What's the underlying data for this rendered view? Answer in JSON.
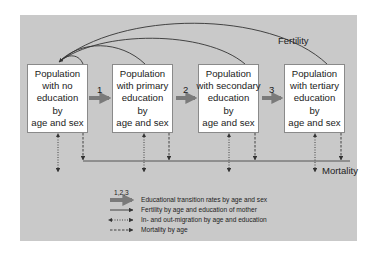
{
  "diagram": {
    "type": "flow",
    "boxes": [
      {
        "lines": [
          "Population",
          "with no",
          "education",
          "by",
          "age and sex"
        ]
      },
      {
        "lines": [
          "Population",
          "with primary",
          "education",
          "by",
          "age and sex"
        ]
      },
      {
        "lines": [
          "Population",
          "with secondary",
          "education",
          "by",
          "age and sex"
        ]
      },
      {
        "lines": [
          "Population",
          "with tertiary",
          "education",
          "by",
          "age and sex"
        ]
      }
    ],
    "transitions": [
      "1",
      "2",
      "3"
    ],
    "fertility_label": "Fertility",
    "mortality_label": "Mortality",
    "legend": {
      "transition_numbers": "1,2,3",
      "items": [
        {
          "style": "thick-grey-arrow",
          "label": "Educational transition rates by age and sex"
        },
        {
          "style": "solid-arrow",
          "label": "Fertility by age and education of mother"
        },
        {
          "style": "dotted-double-arrow",
          "label": "In- and out-migration by age and education"
        },
        {
          "style": "dashed-arrow",
          "label": "Mortality by age"
        }
      ]
    },
    "colors": {
      "panel": "#c9c9c9",
      "box": "#ffffff",
      "transition_arrow": "#7a7a7a",
      "line": "#333333"
    }
  }
}
